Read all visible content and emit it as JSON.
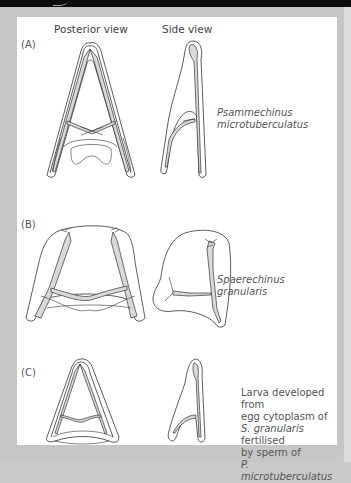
{
  "figure": {
    "column_headers": [
      "Posterior view",
      "Side view"
    ],
    "panels": [
      {
        "label": "(A)",
        "caption_italic": [
          "Psammechinus",
          "microtuberculatus"
        ],
        "description": "Larva of Psammechinus microtuberculatus"
      },
      {
        "label": "(B)",
        "caption_italic": [
          "Spaerechinus",
          "granularis"
        ],
        "description": "Larva of Spaerechinus granularis"
      },
      {
        "label": "(C)",
        "caption_lines": [
          {
            "text": "Larva developed from",
            "italic": false
          },
          {
            "text": "egg cytoplasm of",
            "italic": false
          },
          {
            "italic_part": "S. granularis",
            "plain_part": " fertilised"
          },
          {
            "text": "by sperm of",
            "italic": false
          },
          {
            "text": "P. microtuberculatus",
            "italic": true
          }
        ]
      }
    ]
  },
  "colors": {
    "top_bar": "#0d0d0d",
    "frame": "#c6c6c6",
    "card": "#ffffff",
    "line": "#333333",
    "stipple": "#d9d9d9"
  }
}
